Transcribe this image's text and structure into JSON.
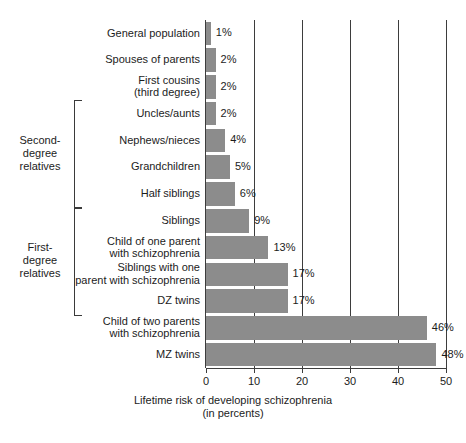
{
  "chart_data": {
    "type": "bar",
    "orientation": "horizontal",
    "title": "",
    "xlabel": "Lifetime risk of developing schizophrenia\n(in percents)",
    "ylabel": "",
    "xlim": [
      0,
      50
    ],
    "xticks": [
      0,
      10,
      20,
      30,
      40,
      50
    ],
    "xtick_labels": [
      "0",
      "10",
      "20",
      "30",
      "40",
      "50"
    ],
    "grid": "vertical",
    "legend": "none",
    "bar_color": "#8c8c8c",
    "axis_color": "#3d3d3d",
    "categories": [
      "General population",
      "Spouses of parents",
      "First cousins\n(third degree)",
      "Uncles/aunts",
      "Nephews/nieces",
      "Grandchildren",
      "Half siblings",
      "Siblings",
      "Child of one parent\nwith schizophrenia",
      "Siblings with one\nparent with schizophrenia",
      "DZ twins",
      "Child of two parents\nwith schizophrenia",
      "MZ twins"
    ],
    "values": [
      1,
      2,
      2,
      2,
      4,
      5,
      6,
      9,
      13,
      17,
      17,
      46,
      48
    ],
    "value_labels": [
      "1%",
      "2%",
      "2%",
      "2%",
      "4%",
      "5%",
      "6%",
      "9%",
      "13%",
      "17%",
      "17%",
      "46%",
      "48%"
    ],
    "groups": [
      {
        "label": "Second-\ndegree\nrelatives",
        "first_index": 3,
        "last_index": 6
      },
      {
        "label": "First-\ndegree\nrelatives",
        "first_index": 7,
        "last_index": 10
      }
    ]
  }
}
